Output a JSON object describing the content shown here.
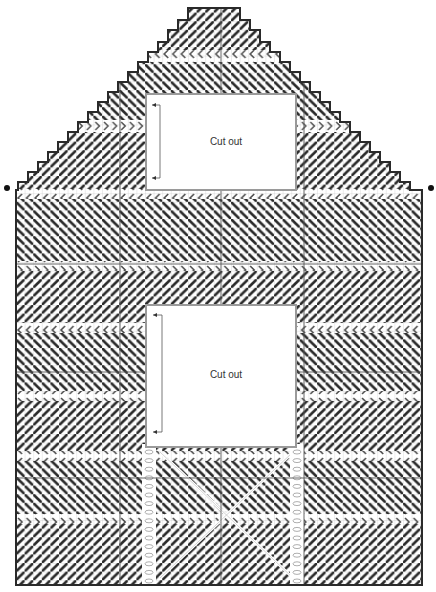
{
  "diagram": {
    "type": "needlepoint-canvas-chart",
    "cutouts": [
      {
        "label": "Cut out",
        "position": "upper window"
      },
      {
        "label": "Cut out",
        "position": "lower window"
      }
    ],
    "colors": {
      "stitch": "#2b2b2b",
      "grid": "#b8b8b8",
      "outline": "#2a2a2a",
      "cutout_border": "#9a9a9a",
      "background": "#ffffff"
    },
    "markers": [
      "left-eave-dot",
      "right-eave-dot"
    ]
  }
}
